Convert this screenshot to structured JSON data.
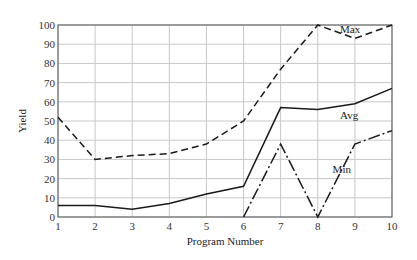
{
  "chart_data": {
    "type": "line",
    "title": "",
    "xlabel": "Program Number",
    "ylabel": "Yield",
    "x": [
      1,
      2,
      3,
      4,
      5,
      6,
      7,
      8,
      9,
      10
    ],
    "xlim": [
      1,
      10
    ],
    "ylim": [
      0,
      100
    ],
    "xticks": [
      "1",
      "2",
      "3",
      "4",
      "5",
      "6",
      "7",
      "8",
      "9",
      "10"
    ],
    "yticks": [
      "0",
      "10",
      "20",
      "30",
      "40",
      "50",
      "60",
      "70",
      "80",
      "90",
      "100"
    ],
    "grid": true,
    "legend": "none (inline annotations)",
    "series": [
      {
        "name": "Max",
        "style": "dashed",
        "x": [
          1,
          2,
          3,
          4,
          5,
          6,
          7,
          8,
          9,
          10
        ],
        "values": [
          52,
          30,
          32,
          33,
          38,
          50,
          77,
          100,
          93,
          100
        ],
        "annotation": {
          "text": "Max",
          "x": 8.6,
          "y": 96
        }
      },
      {
        "name": "Avg",
        "style": "solid",
        "x": [
          1,
          2,
          3,
          4,
          5,
          6,
          7,
          8,
          9,
          10
        ],
        "values": [
          6,
          6,
          4,
          7,
          12,
          16,
          57,
          56,
          59,
          67
        ],
        "annotation": {
          "text": "Avg",
          "x": 8.6,
          "y": 51
        }
      },
      {
        "name": "Min",
        "style": "dash-dot",
        "x": [
          6,
          7,
          8,
          9,
          10
        ],
        "values": [
          0,
          38,
          0,
          38,
          45
        ],
        "annotation": {
          "text": "Min",
          "x": 8.4,
          "y": 23
        }
      }
    ]
  }
}
